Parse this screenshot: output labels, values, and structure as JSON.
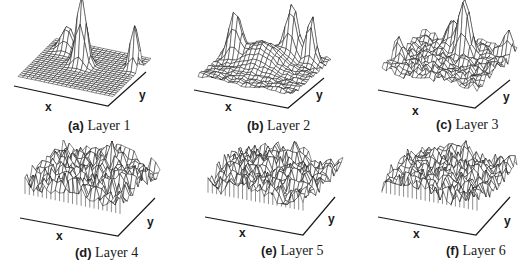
{
  "figure": {
    "panels": [
      {
        "tag": "(a)",
        "title": "Layer 1",
        "x_label": "x",
        "y_label": "y"
      },
      {
        "tag": "(b)",
        "title": "Layer 2",
        "x_label": "x",
        "y_label": "y"
      },
      {
        "tag": "(c)",
        "title": "Layer 3",
        "x_label": "x",
        "y_label": "y"
      },
      {
        "tag": "(d)",
        "title": "Layer 4",
        "x_label": "x",
        "y_label": "y"
      },
      {
        "tag": "(e)",
        "title": "Layer 5",
        "x_label": "x",
        "y_label": "y"
      },
      {
        "tag": "(f)",
        "title": "Layer 6",
        "x_label": "x",
        "y_label": "y"
      }
    ],
    "colors": {
      "mesh": "#1a1a1a",
      "fill": "#ffffff",
      "axis": "#1a1a1a"
    }
  },
  "chart_data": [
    {
      "type": "surface",
      "title": "(a) Layer 1",
      "xlabel": "x",
      "ylabel": "y",
      "grid": false,
      "base": 0.05,
      "roughness": 0.0,
      "peaks": [
        {
          "u": 0.45,
          "v": 0.55,
          "h": 1.0,
          "w": 0.05
        },
        {
          "u": 0.2,
          "v": 0.8,
          "h": 0.35,
          "w": 0.06
        },
        {
          "u": 0.95,
          "v": 0.7,
          "h": 0.7,
          "w": 0.04
        }
      ]
    },
    {
      "type": "surface",
      "title": "(b) Layer 2",
      "xlabel": "x",
      "ylabel": "y",
      "grid": false,
      "base": 0.15,
      "roughness": 0.05,
      "peaks": [
        {
          "u": 0.15,
          "v": 0.6,
          "h": 0.75,
          "w": 0.06
        },
        {
          "u": 0.65,
          "v": 0.85,
          "h": 0.85,
          "w": 0.06
        },
        {
          "u": 0.85,
          "v": 0.85,
          "h": 0.8,
          "w": 0.04
        },
        {
          "u": 0.45,
          "v": 0.6,
          "h": 0.35,
          "w": 0.15
        }
      ]
    },
    {
      "type": "surface",
      "title": "(c) Layer 3",
      "xlabel": "x",
      "ylabel": "y",
      "grid": false,
      "base": 0.25,
      "roughness": 0.12,
      "peaks": [
        {
          "u": 0.55,
          "v": 0.75,
          "h": 0.9,
          "w": 0.05
        },
        {
          "u": 0.05,
          "v": 0.3,
          "h": 0.35,
          "w": 0.05
        },
        {
          "u": 0.95,
          "v": 0.9,
          "h": 0.4,
          "w": 0.05
        },
        {
          "u": 0.4,
          "v": 0.85,
          "h": 0.4,
          "w": 0.07
        }
      ]
    },
    {
      "type": "surface",
      "title": "(d) Layer 4",
      "xlabel": "x",
      "ylabel": "y",
      "grid": false,
      "base": 0.45,
      "roughness": 0.35,
      "peaks": [
        {
          "u": 0.6,
          "v": 0.8,
          "h": 0.3,
          "w": 0.05
        }
      ]
    },
    {
      "type": "surface",
      "title": "(e) Layer 5",
      "xlabel": "x",
      "ylabel": "y",
      "grid": false,
      "base": 0.4,
      "roughness": 0.3,
      "peaks": [
        {
          "u": 0.55,
          "v": 0.9,
          "h": 0.35,
          "w": 0.04
        }
      ]
    },
    {
      "type": "surface",
      "title": "(f) Layer 6",
      "xlabel": "x",
      "ylabel": "y",
      "grid": false,
      "base": 0.4,
      "roughness": 0.3,
      "peaks": [
        {
          "u": 0.5,
          "v": 0.9,
          "h": 0.25,
          "w": 0.04
        }
      ]
    }
  ]
}
